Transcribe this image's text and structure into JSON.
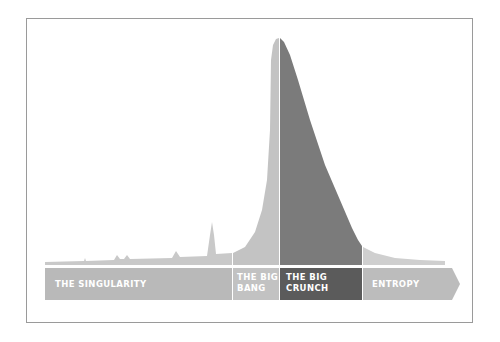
{
  "diagram": {
    "type": "timeline-area-diagram",
    "colors": {
      "light": "#c3c3c3",
      "dark_area": "#7b7b7b",
      "dark_bar": "#5b5b5b",
      "bar_light": "#b9b9b9",
      "frame": "#9a9a9a"
    },
    "segments": [
      {
        "id": "singularity",
        "line1": "THE SINGULARITY",
        "line2": ""
      },
      {
        "id": "big-bang",
        "line1": "THE BIG",
        "line2": "BANG"
      },
      {
        "id": "big-crunch",
        "line1": "THE BIG",
        "line2": "CRUNCH"
      },
      {
        "id": "entropy",
        "line1": "ENTROPY",
        "line2": ""
      }
    ]
  }
}
